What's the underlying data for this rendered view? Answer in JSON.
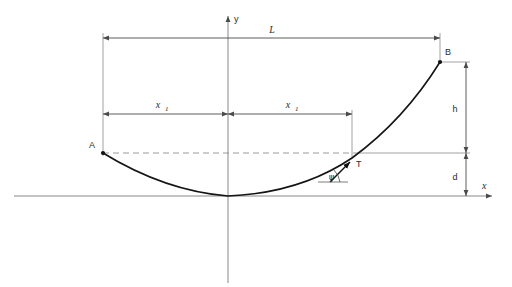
{
  "figure": {
    "type": "engineering-diagram",
    "background_color": "#ffffff",
    "line_color": "#6e6e6e",
    "curve_color": "#1a1a1a",
    "text_color": "#2b2b2b"
  },
  "axes": {
    "x_label": "x",
    "y_label": "y",
    "origin_x": 228,
    "origin_y": 196,
    "x_axis_left": 14,
    "x_axis_right": 498,
    "y_axis_top": 14,
    "y_axis_bottom": 283
  },
  "points": [
    {
      "name": "A",
      "label": "A",
      "x": 103,
      "y": 153,
      "label_dx": -12,
      "label_dy": -6
    },
    {
      "name": "B",
      "label": "B",
      "x": 440,
      "y": 62,
      "label_dx": 5,
      "label_dy": -5
    },
    {
      "name": "T",
      "label": "T",
      "x": 352,
      "y": 160,
      "label_dx": 7,
      "label_dy": 6
    }
  ],
  "dimensions": [
    {
      "name": "span",
      "label": "L",
      "italic": true,
      "orientation": "horizontal",
      "y": 38,
      "x_start": 103,
      "x_end": 440,
      "label_x": 272,
      "label_y": 33
    },
    {
      "name": "half-span-left",
      "label": "x",
      "subscript": "1",
      "italic": true,
      "orientation": "horizontal",
      "y": 114,
      "x_start": 103,
      "x_end": 228,
      "label_x": 160,
      "label_y": 108
    },
    {
      "name": "half-span-right",
      "label": "x",
      "subscript": "1",
      "italic": true,
      "orientation": "horizontal",
      "y": 114,
      "x_start": 228,
      "x_end": 352,
      "label_x": 290,
      "label_y": 108
    },
    {
      "name": "height-h",
      "label": "h",
      "italic": false,
      "orientation": "vertical",
      "x": 466,
      "y_start": 62,
      "y_end": 153,
      "label_x": 457,
      "label_y": 110
    },
    {
      "name": "sag-d",
      "label": "d",
      "italic": false,
      "orientation": "vertical",
      "x": 466,
      "y_start": 153,
      "y_end": 196,
      "label_x": 457,
      "label_y": 178
    }
  ],
  "angle": {
    "name": "tangent-angle",
    "label": "ψ",
    "vertex_x": 332,
    "vertex_y": 180,
    "label_x": 331,
    "label_y": 177
  },
  "curve": {
    "name": "parabolic-cable",
    "description": "parabola tangent to x-axis at origin, rising to A on the left and B on the right",
    "vertex": [
      228,
      196
    ],
    "left_end": [
      103,
      153
    ],
    "right_end": [
      440,
      62
    ],
    "sampled_points": [
      [
        103,
        153
      ],
      [
        130,
        175
      ],
      [
        158,
        187
      ],
      [
        186,
        194
      ],
      [
        200,
        196
      ],
      [
        228,
        196
      ],
      [
        256,
        192
      ],
      [
        284,
        184
      ],
      [
        312,
        172
      ],
      [
        340,
        155
      ],
      [
        368,
        134
      ],
      [
        396,
        110
      ],
      [
        418,
        87
      ],
      [
        440,
        62
      ]
    ]
  },
  "guide_lines": [
    {
      "name": "level-line-A-dashed",
      "style": "dashed",
      "x1": 103,
      "y1": 153,
      "x2": 358,
      "y2": 153
    },
    {
      "name": "level-line-T-solid",
      "style": "solid",
      "x1": 356,
      "y1": 153,
      "x2": 466,
      "y2": 153
    }
  ],
  "tangent_arrow": {
    "name": "tangent-direction-arrow",
    "from_x": 330,
    "from_y": 181,
    "to_x": 352,
    "to_y": 160
  }
}
